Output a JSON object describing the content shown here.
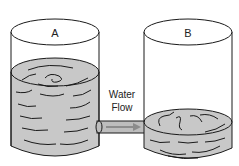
{
  "diagram": {
    "container_a": {
      "label": "A",
      "water_level": "high"
    },
    "container_b": {
      "label": "B",
      "water_level": "low"
    },
    "flow": {
      "label_line1": "Water",
      "label_line2": "Flow",
      "direction": "A-to-B"
    },
    "colors": {
      "water": "#c8c8c8",
      "outline": "#1a1a1a",
      "pipe": "#bdbdbd",
      "arrow": "#8c8c8c"
    }
  }
}
